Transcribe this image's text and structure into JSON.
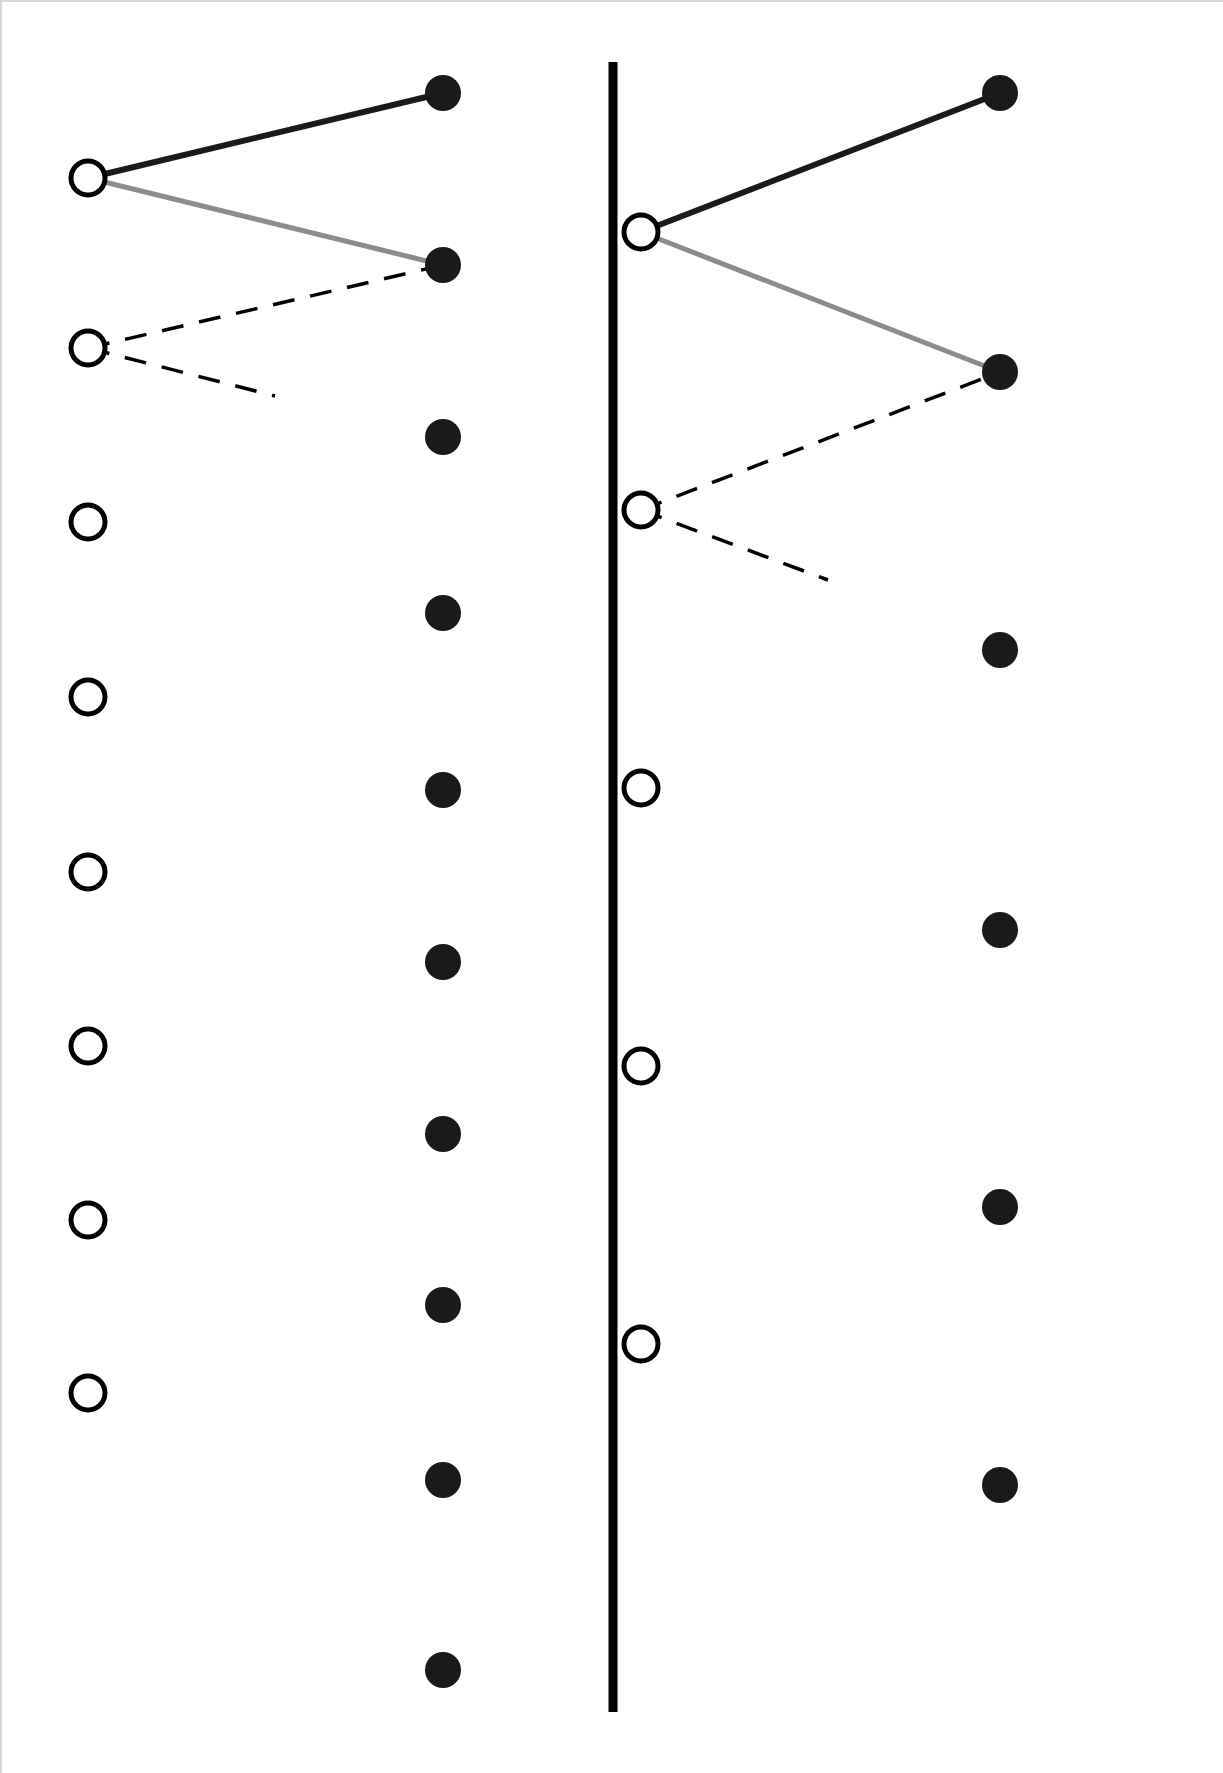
{
  "figure": {
    "title": "",
    "width": 1223,
    "height": 1773,
    "background": "#ffffff",
    "divider": {
      "name": "panel-divider",
      "x": 613,
      "y1": 62,
      "y2": 1712,
      "color": "#000000",
      "width": 9
    }
  },
  "colors": {
    "filled_marker": "#1a1a1a",
    "open_marker_stroke": "#000000",
    "open_marker_fill": "#ffffff",
    "edge_dark": "#1a1a1a",
    "edge_gray": "#8c8c8c",
    "edge_dashed": "#000000",
    "background": "#ffffff"
  },
  "chart_data": {
    "type": "scatter",
    "title": "",
    "subtitle": "",
    "xlabel": "",
    "ylabel": "",
    "grid": false,
    "legend": null,
    "annotations": [],
    "panels": [
      {
        "name": "left-panel",
        "xlim": [
          0,
          613
        ],
        "ylim": [
          0,
          1773
        ],
        "series": [
          {
            "name": "open-circles-left",
            "marker": "open-circle",
            "radius": 17,
            "x": [
              88,
              88,
              88,
              88,
              88,
              88,
              88,
              88
            ],
            "y": [
              178,
              348,
              522,
              697,
              872,
              1046,
              1220,
              1393
            ],
            "count": 8
          },
          {
            "name": "filled-circles-left",
            "marker": "filled-circle",
            "radius": 18,
            "x": [
              443,
              443,
              443,
              443,
              443,
              443,
              443,
              443,
              443,
              443
            ],
            "y": [
              93,
              265,
              437,
              613,
              790,
              962,
              1134,
              1305,
              1480,
              1670
            ],
            "count": 10
          }
        ],
        "edges": [
          {
            "name": "edge-dark-left",
            "style": "solid",
            "color": "#1a1a1a",
            "width": 6,
            "from": [
              88,
              178
            ],
            "to": [
              443,
              93
            ]
          },
          {
            "name": "edge-gray-left",
            "style": "solid",
            "color": "#8c8c8c",
            "width": 5,
            "from": [
              88,
              178
            ],
            "to": [
              443,
              265
            ]
          },
          {
            "name": "edge-dashed-upper-left",
            "style": "dashed",
            "color": "#000000",
            "width": 3.5,
            "from": [
              88,
              348
            ],
            "to": [
              443,
              265
            ]
          },
          {
            "name": "edge-dashed-lower-left",
            "style": "dashed",
            "color": "#000000",
            "width": 3.5,
            "from": [
              88,
              348
            ],
            "to": [
              275,
              396
            ]
          }
        ]
      },
      {
        "name": "right-panel",
        "xlim": [
          613,
          1223
        ],
        "ylim": [
          0,
          1773
        ],
        "series": [
          {
            "name": "open-circles-right",
            "marker": "open-circle",
            "radius": 17,
            "x": [
              641,
              641,
              641,
              641,
              641
            ],
            "y": [
              232,
              510,
              788,
              1066,
              1344
            ],
            "count": 5
          },
          {
            "name": "filled-circles-right",
            "marker": "filled-circle",
            "radius": 18,
            "x": [
              1000,
              1000,
              1000,
              1000,
              1000,
              1000
            ],
            "y": [
              93,
              372,
              650,
              930,
              1207,
              1485
            ],
            "count": 6
          }
        ],
        "edges": [
          {
            "name": "edge-dark-right",
            "style": "solid",
            "color": "#1a1a1a",
            "width": 6,
            "from": [
              641,
              232
            ],
            "to": [
              1000,
              93
            ]
          },
          {
            "name": "edge-gray-right",
            "style": "solid",
            "color": "#8c8c8c",
            "width": 5,
            "from": [
              641,
              232
            ],
            "to": [
              1000,
              372
            ]
          },
          {
            "name": "edge-dashed-upper-right",
            "style": "dashed",
            "color": "#000000",
            "width": 3.5,
            "from": [
              641,
              510
            ],
            "to": [
              1000,
              372
            ]
          },
          {
            "name": "edge-dashed-lower-right",
            "style": "dashed",
            "color": "#000000",
            "width": 3.5,
            "from": [
              641,
              510
            ],
            "to": [
              828,
              580
            ]
          }
        ]
      }
    ]
  }
}
